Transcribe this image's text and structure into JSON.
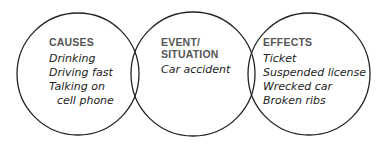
{
  "diagram": {
    "type": "three-circle cause-effect diagram",
    "stroke_color": "#222222",
    "sections": [
      {
        "heading": "CAUSES",
        "items": [
          "Drinking",
          "Driving fast",
          "Talking on",
          "cell phone"
        ]
      },
      {
        "heading_line1": "EVENT/",
        "heading_line2": "SITUATION",
        "items": [
          "Car accident"
        ]
      },
      {
        "heading": "EFFECTS",
        "items": [
          "Ticket",
          "Suspended license",
          "Wrecked car",
          "Broken ribs"
        ]
      }
    ]
  }
}
